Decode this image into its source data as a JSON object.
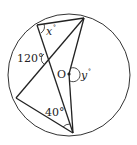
{
  "diagram": {
    "type": "circle-geometry",
    "circle": {
      "center_label": "O"
    },
    "labels": {
      "angle_x": "x",
      "angle_x_deg": "°",
      "angle_120": "120°",
      "center": "O",
      "angle_y": "y",
      "angle_y_deg": "°",
      "angle_40": "40°"
    },
    "colors": {
      "stroke": "#222222",
      "background": "#ffffff"
    }
  }
}
